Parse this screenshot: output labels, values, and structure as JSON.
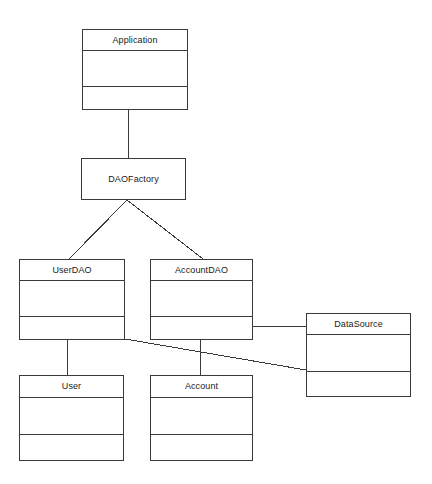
{
  "diagram": {
    "type": "uml-class-diagram",
    "background_color": "#ffffff",
    "line_color": "#3a3a3a",
    "text_color": "#1a1a1a",
    "canvas": {
      "width": 432,
      "height": 484
    },
    "classes": [
      {
        "id": "application",
        "name": "Application",
        "x": 82,
        "y": 29,
        "width": 106,
        "height": 81,
        "compartments": [
          {
            "kind": "name",
            "height": 21
          },
          {
            "kind": "attributes",
            "height": 36
          },
          {
            "kind": "operations",
            "height": 24
          }
        ]
      },
      {
        "id": "daofactory",
        "name": "DAOFactory",
        "x": 81,
        "y": 158,
        "width": 105,
        "height": 42,
        "compartments": [
          {
            "kind": "name",
            "height": 42
          }
        ]
      },
      {
        "id": "userdao",
        "name": "UserDAO",
        "x": 19,
        "y": 259,
        "width": 106,
        "height": 81,
        "compartments": [
          {
            "kind": "name",
            "height": 21
          },
          {
            "kind": "attributes",
            "height": 36
          },
          {
            "kind": "operations",
            "height": 24
          }
        ]
      },
      {
        "id": "accountdao",
        "name": "AccountDAO",
        "x": 150,
        "y": 259,
        "width": 103,
        "height": 81,
        "compartments": [
          {
            "kind": "name",
            "height": 21
          },
          {
            "kind": "attributes",
            "height": 36
          },
          {
            "kind": "operations",
            "height": 24
          }
        ]
      },
      {
        "id": "datasource",
        "name": "DataSource",
        "x": 306,
        "y": 313,
        "width": 105,
        "height": 84,
        "compartments": [
          {
            "kind": "name",
            "height": 21
          },
          {
            "kind": "attributes",
            "height": 37
          },
          {
            "kind": "operations",
            "height": 26
          }
        ]
      },
      {
        "id": "user",
        "name": "User",
        "x": 19,
        "y": 375,
        "width": 105,
        "height": 86,
        "compartments": [
          {
            "kind": "name",
            "height": 21
          },
          {
            "kind": "attributes",
            "height": 38
          },
          {
            "kind": "operations",
            "height": 27
          }
        ]
      },
      {
        "id": "account",
        "name": "Account",
        "x": 150,
        "y": 375,
        "width": 103,
        "height": 86,
        "compartments": [
          {
            "kind": "name",
            "height": 21
          },
          {
            "kind": "attributes",
            "height": 38
          },
          {
            "kind": "operations",
            "height": 27
          }
        ]
      }
    ],
    "connectors": [
      {
        "id": "application-daofactory",
        "from": "application",
        "to": "daofactory",
        "points": [
          [
            128,
            110
          ],
          [
            128,
            158
          ]
        ]
      },
      {
        "id": "daofactory-userdao",
        "from": "daofactory",
        "to": "userdao",
        "points": [
          [
            127,
            200
          ],
          [
            69,
            259
          ]
        ]
      },
      {
        "id": "daofactory-accountdao",
        "from": "daofactory",
        "to": "accountdao",
        "points": [
          [
            127,
            200
          ],
          [
            203,
            259
          ]
        ]
      },
      {
        "id": "userdao-user",
        "from": "userdao",
        "to": "user",
        "points": [
          [
            67,
            340
          ],
          [
            67,
            375
          ]
        ]
      },
      {
        "id": "accountdao-account",
        "from": "accountdao",
        "to": "account",
        "points": [
          [
            200,
            340
          ],
          [
            200,
            375
          ]
        ]
      },
      {
        "id": "accountdao-datasource",
        "from": "accountdao",
        "to": "datasource",
        "points": [
          [
            253,
            326
          ],
          [
            306,
            326
          ]
        ]
      },
      {
        "id": "userdao-datasource",
        "from": "userdao",
        "to": "datasource",
        "points": [
          [
            125,
            339
          ],
          [
            306,
            370
          ]
        ]
      }
    ]
  }
}
